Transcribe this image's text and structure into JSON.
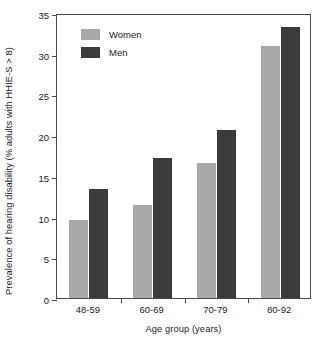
{
  "chart_data": {
    "type": "bar",
    "title": "",
    "subtitle": "",
    "xlabel": "Age group (years)",
    "ylabel": "Prevalence of hearing disability (% adults with HHIE-S > 8)",
    "categories": [
      "48-59",
      "60-69",
      "70-79",
      "80-92"
    ],
    "series": [
      {
        "name": "Women",
        "color": "#a9a9a9",
        "values": [
          9.6,
          11.4,
          16.6,
          31.0
        ]
      },
      {
        "name": "Men",
        "color": "#3b3b3b",
        "values": [
          13.4,
          17.2,
          20.6,
          33.3
        ]
      }
    ],
    "ylim": [
      0,
      35
    ],
    "ytick_labels": [
      "0",
      "5",
      "10",
      "15",
      "20",
      "25",
      "30",
      "35"
    ],
    "ytick_values": [
      0,
      5,
      10,
      15,
      20,
      25,
      30,
      35
    ],
    "grid": false,
    "legend_position": "top-left",
    "legend_entries": [
      "Women",
      "Men"
    ],
    "annotations": []
  }
}
